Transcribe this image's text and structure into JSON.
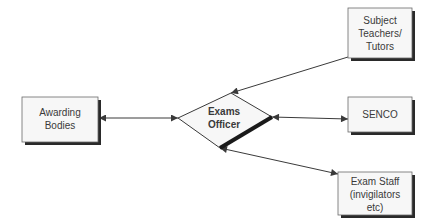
{
  "diagram": {
    "type": "flowchart",
    "colors": {
      "box_fill": "#f7f7f7",
      "box_border": "#6a6a6a",
      "shadow": "#2a2a2a",
      "line": "#3a3a3a",
      "text": "#3a3a3a"
    },
    "nodes": {
      "awarding_bodies": {
        "lines": [
          "Awarding",
          "Bodies"
        ]
      },
      "exams_officer": {
        "lines": [
          "Exams",
          "Officer"
        ]
      },
      "subject_teachers": {
        "lines": [
          "Subject",
          "Teachers/",
          "Tutors"
        ]
      },
      "senco": {
        "lines": [
          "SENCO"
        ]
      },
      "exam_staff": {
        "lines": [
          "Exam Staff",
          "(invigilators",
          "etc)"
        ]
      }
    },
    "edges": [
      {
        "from": "awarding_bodies",
        "to": "exams_officer",
        "direction": "both"
      },
      {
        "from": "subject_teachers",
        "to": "exams_officer",
        "direction": "forward"
      },
      {
        "from": "exams_officer",
        "to": "senco",
        "direction": "both"
      },
      {
        "from": "exams_officer",
        "to": "exam_staff",
        "direction": "both"
      }
    ]
  }
}
